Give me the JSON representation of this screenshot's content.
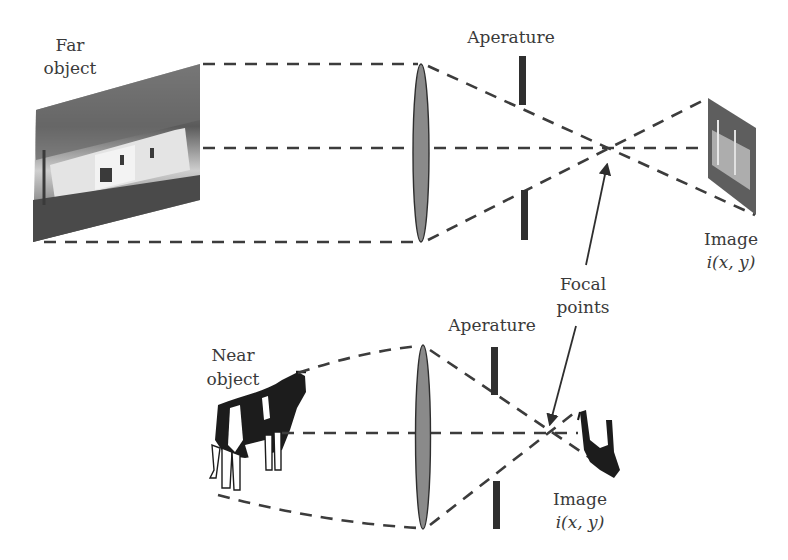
{
  "diagram": {
    "far_scene": {
      "object_label_line1": "Far",
      "object_label_line2": "object",
      "aperture_label": "Aperature",
      "image_label_line1": "Image",
      "image_label_line2": "i(x, y)"
    },
    "near_scene": {
      "object_label_line1": "Near",
      "object_label_line2": "object",
      "aperture_label": "Aperature",
      "image_label_line1": "Image",
      "image_label_line2": "i(x, y)"
    },
    "focal_label_line1": "Focal",
    "focal_label_line2": "points",
    "colors": {
      "lens_fill": "#8a8a8a",
      "aperture": "#2f2f2f",
      "lines": "#3c3c3c",
      "text": "#3a3a3a"
    }
  }
}
